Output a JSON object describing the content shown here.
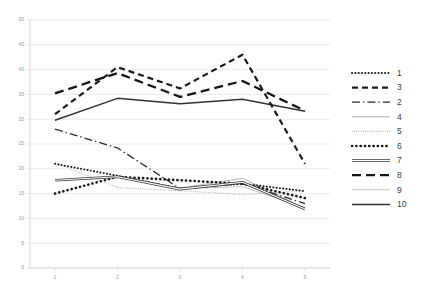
{
  "chart_data": {
    "type": "line",
    "title": "",
    "subtitle": "",
    "xlabel": "",
    "ylabel": "",
    "x": [
      1,
      2,
      3,
      4,
      5
    ],
    "xticklabels": [
      "1",
      "2",
      "3",
      "4",
      "5"
    ],
    "yticks": [
      0,
      5,
      10,
      15,
      20,
      25,
      30,
      35,
      40,
      45,
      50
    ],
    "yticklabels": [
      "0",
      "5",
      "10",
      "15",
      "20",
      "25",
      "30",
      "35",
      "40",
      "45",
      "50"
    ],
    "ylim": [
      0,
      50
    ],
    "xlim": [
      0.6,
      5.4
    ],
    "grid": "horizontal",
    "grid_color": "#e4e4e4",
    "axis_color": "#d9d9d9",
    "background": "#ffffff",
    "legend_position": "right",
    "legend_order": [
      "1",
      "3",
      "2",
      "4",
      "5",
      "6",
      "7",
      "8",
      "9",
      "10"
    ],
    "series": [
      {
        "name": "1",
        "label": "1",
        "style": "fine-dotted",
        "color": "#1a1a1a",
        "width": 1.9,
        "dash": "0.2,3.1",
        "linecap": "round",
        "values": [
          21.0,
          18.6,
          16.0,
          17.0,
          15.5
        ]
      },
      {
        "name": "3",
        "label": "3",
        "style": "thick-dashed",
        "color": "#1a1a1a",
        "width": 2.2,
        "dash": "6,4",
        "linecap": "butt",
        "values": [
          31.0,
          40.5,
          36.2,
          43.0,
          21.0
        ]
      },
      {
        "name": "2",
        "label": "2",
        "style": "dash-dot",
        "color": "#2b2b2b",
        "width": 1.3,
        "dash": "8,3,1.4,3",
        "linecap": "butt",
        "values": [
          28.0,
          24.2,
          16.0,
          17.0,
          13.0
        ]
      },
      {
        "name": "4",
        "label": "4",
        "style": "thin-solid-light",
        "color": "#a9a9a9",
        "width": 0.9,
        "dash": "none",
        "linecap": "butt",
        "values": [
          17.7,
          18.4,
          16.1,
          18.1,
          12.0
        ]
      },
      {
        "name": "5",
        "label": "5",
        "style": "light-dotted",
        "color": "#8d8d8d",
        "width": 1.1,
        "dash": "0.6,1.6",
        "linecap": "butt",
        "values": [
          21.3,
          16.2,
          15.6,
          14.8,
          15.6
        ]
      },
      {
        "name": "6",
        "label": "6",
        "style": "bold-dotted",
        "color": "#1a1a1a",
        "width": 2.6,
        "dash": "0.2,4.1",
        "linecap": "round",
        "values": [
          15.0,
          18.4,
          17.7,
          17.0,
          14.1
        ]
      },
      {
        "name": "7",
        "label": "7",
        "style": "hollow-outline",
        "color": "#3a3a3a",
        "width": 2.6,
        "dash": "none",
        "linecap": "butt",
        "values": [
          17.7,
          18.4,
          15.9,
          17.3,
          11.9
        ]
      },
      {
        "name": "8",
        "label": "8",
        "style": "long-dash",
        "color": "#151515",
        "width": 2.3,
        "dash": "9,5",
        "linecap": "butt",
        "values": [
          35.2,
          39.3,
          34.5,
          37.7,
          31.7
        ]
      },
      {
        "name": "9",
        "label": "9",
        "style": "thin-solid-pale",
        "color": "#bdbdbd",
        "width": 0.9,
        "dash": "none",
        "linecap": "butt",
        "values": [
          17.6,
          18.3,
          16.0,
          16.4,
          12.1
        ]
      },
      {
        "name": "10",
        "label": "10",
        "style": "thick-solid",
        "color": "#333333",
        "width": 1.5,
        "dash": "none",
        "linecap": "butt",
        "values": [
          29.8,
          34.2,
          33.1,
          34.0,
          31.6
        ]
      }
    ]
  }
}
